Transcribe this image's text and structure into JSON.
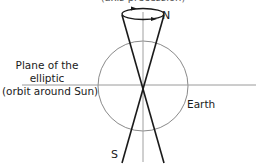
{
  "diagram": {
    "caption_top": "(axis precession)",
    "labels": {
      "north": "N",
      "south": "S",
      "earth": "Earth",
      "plane": [
        "Plane of the",
        "elliptic",
        "(orbit around Sun)"
      ]
    },
    "colors": {
      "axis_line": "#1a1a1a",
      "guide_line": "#9a9a9a",
      "earth_circle": "#8a8a8a",
      "text": "#1a1a1a"
    }
  }
}
